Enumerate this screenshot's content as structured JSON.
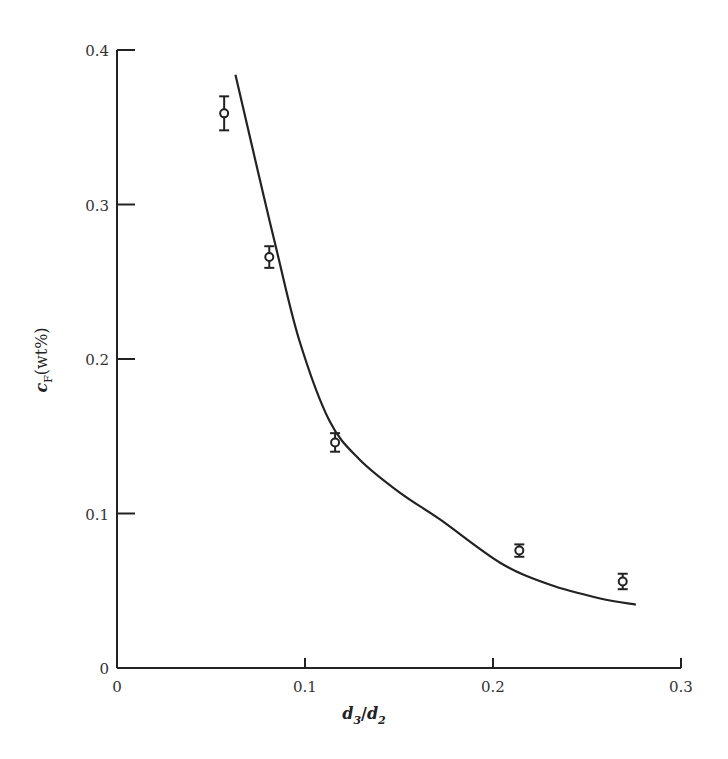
{
  "chart_data": {
    "type": "scatter",
    "title": "",
    "xlabel": "d3/d2",
    "xlabel_parts": {
      "d": "d",
      "sub1": "3",
      "slash": "/",
      "sub2": "2"
    },
    "ylabel": "cF(wt%)",
    "ylabel_parts": {
      "c": "c",
      "sub": "F",
      "rest": "(wt%)"
    },
    "xlim": [
      0,
      0.3
    ],
    "ylim": [
      0,
      0.4
    ],
    "xticks": [
      0,
      0.1,
      0.2,
      0.3
    ],
    "xtick_labels": [
      "0",
      "0.1",
      "0.2",
      "0.3"
    ],
    "yticks": [
      0,
      0.1,
      0.2,
      0.3,
      0.4
    ],
    "ytick_labels": [
      "0",
      "0.1",
      "0.2",
      "0.3",
      "0.4"
    ],
    "grid": false,
    "legend": null,
    "series": [
      {
        "name": "measured",
        "kind": "scatter-errorbar",
        "marker": "open-circle",
        "x": [
          0.057,
          0.081,
          0.116,
          0.214,
          0.269
        ],
        "y": [
          0.359,
          0.266,
          0.146,
          0.076,
          0.056
        ],
        "yerr": [
          0.011,
          0.007,
          0.006,
          0.004,
          0.005
        ]
      },
      {
        "name": "fit",
        "kind": "line",
        "x": [
          0.063,
          0.076,
          0.085,
          0.097,
          0.113,
          0.129,
          0.151,
          0.172,
          0.204,
          0.23,
          0.257,
          0.276
        ],
        "y": [
          0.384,
          0.316,
          0.27,
          0.212,
          0.16,
          0.135,
          0.113,
          0.096,
          0.068,
          0.054,
          0.045,
          0.041
        ]
      }
    ]
  },
  "colors": {
    "ink": "#222222",
    "background": "#ffffff"
  }
}
